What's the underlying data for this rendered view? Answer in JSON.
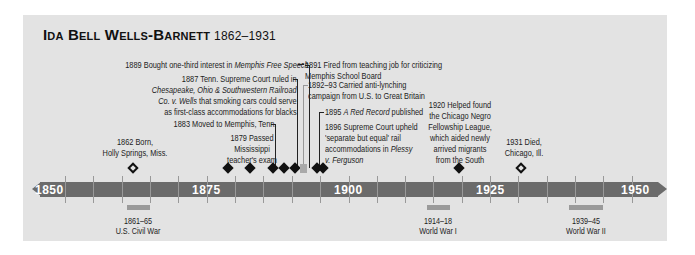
{
  "title": {
    "name": "Ida Bell Wells-Barnett",
    "years": "1862–1931"
  },
  "axis": {
    "labels": [
      "1850",
      "1875",
      "1900",
      "1925",
      "1950"
    ]
  },
  "events": [
    {
      "id": "e1862",
      "text1": "1862 Born,",
      "text2": "Holly Springs, Miss."
    },
    {
      "id": "e1879",
      "text1": "1879 Passed",
      "text2": "Mississippi",
      "text3": "teacher's exam"
    },
    {
      "id": "e1883",
      "text": "1883 Moved to Memphis, Tenn."
    },
    {
      "id": "e1887",
      "line1": "1887 Tenn. Supreme Court ruled in",
      "line2": "Chesapeake, Ohio & Southwestern Railroad",
      "line3a": "Co. v. Wells",
      "line3b": " that smoking cars could serve",
      "line4": "as first-class accommodations for blacks"
    },
    {
      "id": "e1889",
      "pre": "1889 Bought one-third interest in ",
      "ital": "Memphis Free Speech"
    },
    {
      "id": "e1891",
      "line1": "1891 Fired from teaching job for criticizing",
      "line2": "Memphis School Board"
    },
    {
      "id": "e1892",
      "line1": "1892–93 Carried anti-lynching",
      "line2": "campaign from U.S. to Great Britain"
    },
    {
      "id": "e1895",
      "pre": "1895 ",
      "ital": "A Red Record",
      "post": " published"
    },
    {
      "id": "e1896",
      "line1": "1896 Supreme Court upheld",
      "line2": "'separate but equal' rail",
      "line3a": "accommodations in ",
      "line3b": "Plessy",
      "line4": "v. Ferguson"
    },
    {
      "id": "e1920",
      "lines": [
        "1920 Helped found",
        "the Chicago Negro",
        "Fellowship League,",
        "which aided newly",
        "arrived migrants",
        "from the South"
      ]
    },
    {
      "id": "e1931",
      "text1": "1931 Died,",
      "text2": "Chicago, Ill."
    }
  ],
  "wars": [
    {
      "years": "1861–65",
      "name": "U.S. Civil War"
    },
    {
      "years": "1914–18",
      "name": "World War I"
    },
    {
      "years": "1939–45",
      "name": "World War II"
    }
  ]
}
